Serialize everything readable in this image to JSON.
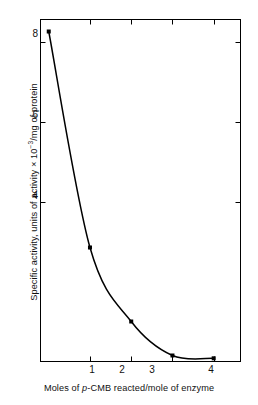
{
  "chart_data": {
    "type": "line",
    "title": "",
    "subtitle": "",
    "xlabel_parts": {
      "pre": "Moles of ",
      "italic": "p",
      "post": "-CMB reacted/mole of enzyme"
    },
    "xlabel": "Moles of p-CMB reacted/mole of enzyme",
    "ylabel": "Specific activity, units of activity × 10⁻³/mg of protein",
    "ylabel_parts": {
      "pre": "Specific activity, units of activity × 10",
      "exponent": "−3",
      "post": "/mg of protein"
    },
    "x": [
      0,
      1,
      2,
      3,
      4
    ],
    "values": [
      8.25,
      2.85,
      1.0,
      0.15,
      0.08
    ],
    "series": [
      {
        "name": "Specific activity",
        "values": [
          8.25,
          2.85,
          1.0,
          0.15,
          0.08
        ]
      }
    ],
    "xlim": [
      -0.2,
      4.65
    ],
    "ylim": [
      0,
      8.55
    ],
    "xticks": [
      1,
      2,
      3,
      4
    ],
    "xtick_labels": [
      "1",
      "2",
      "3",
      "4"
    ],
    "yticks": [
      4,
      6,
      8
    ],
    "ytick_labels": [
      "4",
      "6",
      "8"
    ],
    "grid": false,
    "legend": "none",
    "marker": "square",
    "marker_color": "#000000",
    "line_color": "#000000",
    "axis_color": "#000000",
    "background": "#ffffff",
    "frame": "box",
    "tick_direction": "in"
  },
  "figure": {
    "caption": "",
    "annotations": []
  }
}
